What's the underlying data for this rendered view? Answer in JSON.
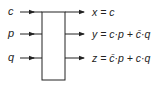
{
  "diagram": {
    "type": "reversible-logic-gate",
    "inputs": [
      {
        "label": "c"
      },
      {
        "label": "p"
      },
      {
        "label": "q"
      }
    ],
    "outputs": [
      {
        "label": "x = c",
        "lhs": "x",
        "rhs_parts": [
          "c"
        ]
      },
      {
        "label": "y = c·p + c̄·q",
        "lhs": "y",
        "rhs": "c·p + c̄·q"
      },
      {
        "label": "z = c̄·p + c·q",
        "lhs": "z",
        "rhs": "c̄·p + c·q"
      }
    ],
    "colors": {
      "line": "#222222",
      "box_fill": "#ffffff"
    }
  }
}
